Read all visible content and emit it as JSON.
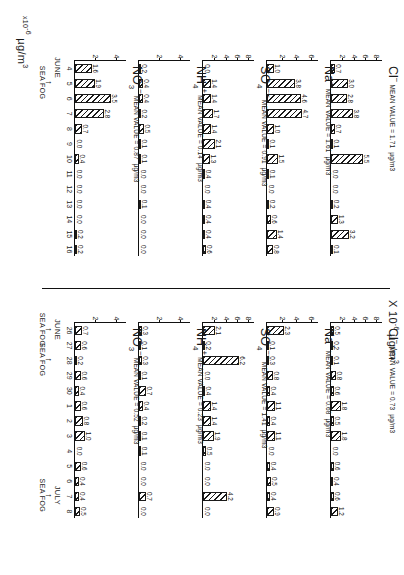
{
  "figure": {
    "caption_left": "µg/m3",
    "axis_label_lower": "x10-6 µg/m3",
    "axis_label_upper": "X 10-6 µg/m3",
    "units_mu": "µg/m",
    "units_exp": "3",
    "x10": "X 10",
    "x10_exp": "-6",
    "month_june": "JUNE",
    "month_july": "JULY",
    "sea_fog": "SEA FOG"
  },
  "chart_data": {
    "type": "bar",
    "ylabel": "µg/m3",
    "xlabel": "Day",
    "grid": false,
    "legend": "none",
    "panels": [
      {
        "id": "cl-period1",
        "species": "Cl",
        "charge": "−",
        "mean_label": "MEAN VALUE = 1.71",
        "mean_value": 1.71,
        "units": "µg/m3",
        "ylim": [
          0,
          9
        ],
        "yticks": [
          2,
          4,
          6,
          8
        ],
        "period": "june-4-16",
        "categories": [
          "4",
          "5",
          "6",
          "7",
          "8",
          "9",
          "10",
          "11",
          "12",
          "13",
          "14",
          "15",
          "16"
        ],
        "values": [
          0.7,
          3.0,
          2.8,
          3.8,
          0.7,
          0.1,
          5.5,
          0.0,
          0.0,
          0.2,
          1.3,
          3.2,
          0.1
        ],
        "extra_value": 0.4
      },
      {
        "id": "na-period1",
        "species": "Na",
        "charge": "+",
        "mean_label": "MEAN VALUE = 1.61",
        "mean_value": 1.61,
        "units": "µg/m3",
        "ylim": [
          0,
          7
        ],
        "yticks": [
          2,
          4,
          6
        ],
        "period": "june-4-16",
        "categories": [
          "4",
          "5",
          "6",
          "7",
          "8",
          "9",
          "10",
          "11",
          "12",
          "13",
          "14",
          "15",
          "16"
        ],
        "values": [
          1.0,
          3.8,
          4.6,
          4.7,
          1.0,
          0.1,
          1.5,
          0.1,
          0.0,
          0.2,
          0.6,
          1.4,
          0.8
        ],
        "extra_value": 1.2
      },
      {
        "id": "so4-period1",
        "species": "SO",
        "charge": "−−",
        "subscript": "4",
        "mean_label": "MEAN VALUE = 0.91",
        "mean_value": 0.91,
        "units": "µg/m3",
        "ylim": [
          0,
          9
        ],
        "yticks": [
          2,
          4,
          6,
          8
        ],
        "period": "june-4-16",
        "categories": [
          "4",
          "5",
          "6",
          "7",
          "8",
          "9",
          "10",
          "11",
          "12",
          "13",
          "14",
          "15",
          "16"
        ],
        "values": [
          0.0,
          1.4,
          1.4,
          1.7,
          1.4,
          2.1,
          1.3,
          0.4,
          0.0,
          0.4,
          0.4,
          0.4,
          0.6
        ],
        "extra_values": [
          0.7,
          0.9
        ]
      },
      {
        "id": "nh4-period1",
        "species": "NH",
        "charge": "+",
        "subscript": "4",
        "mean_label": "MEAN VALUE = 0.14",
        "mean_value": 0.14,
        "units": "µg/m3",
        "ylim": [
          0,
          5
        ],
        "yticks": [
          2,
          4
        ],
        "period": "june-4-16",
        "categories": [
          "4",
          "5",
          "6",
          "7",
          "8",
          "9",
          "10",
          "11",
          "12",
          "13",
          "14",
          "15",
          "16"
        ],
        "values": [
          0.2,
          0.4,
          0.4,
          0.2,
          0.5,
          0.1,
          0.1,
          0.0,
          0.0,
          0.1,
          0.0,
          0.0,
          0.0
        ],
        "extra_values": [
          0.0,
          0.0
        ]
      },
      {
        "id": "no3-period1",
        "species": "NO",
        "charge": "−",
        "subscript": "3",
        "mean_label": "MEAN VALUE = 0.87",
        "mean_value": 0.87,
        "units": "µg/m3",
        "ylim": [
          0,
          5
        ],
        "yticks": [
          2,
          4
        ],
        "period": "june-4-16",
        "categories": [
          "4",
          "5",
          "6",
          "7",
          "8",
          "9",
          "10",
          "11",
          "12",
          "13",
          "14",
          "15",
          "16"
        ],
        "values": [
          1.6,
          1.9,
          3.5,
          2.8,
          0.7,
          0.0,
          0.4,
          0.0,
          0.0,
          0.0,
          0.0,
          0.2,
          0.2
        ],
        "extra_value": 0.8
      },
      {
        "id": "cl-period2",
        "species": "Cl",
        "charge": "−",
        "mean_label": "MEAN VALUE = 0.73",
        "mean_value": 0.73,
        "units": "µg/m3",
        "ylim": [
          0,
          9
        ],
        "yticks": [
          2,
          4,
          6,
          8
        ],
        "period": "june26-july8",
        "categories": [
          "26",
          "27",
          "28",
          "29",
          "30",
          "1",
          "2",
          "3",
          "4",
          "5",
          "6",
          "7",
          "8"
        ],
        "values": [
          0.5,
          0.2,
          0.1,
          0.8,
          0.6,
          1.8,
          0.5,
          1.8,
          0.0,
          0.6,
          0.4,
          0.6,
          1.2
        ]
      },
      {
        "id": "na-period2",
        "species": "Na",
        "charge": "+",
        "mean_label": "MEAN VALUE = 0.68",
        "mean_value": 0.68,
        "units": "µg/m3",
        "ylim": [
          0,
          7
        ],
        "yticks": [
          2,
          4,
          6
        ],
        "period": "june26-july8",
        "categories": [
          "26",
          "27",
          "28",
          "29",
          "30",
          "1",
          "2",
          "3",
          "4",
          "5",
          "6",
          "7",
          "8"
        ],
        "values": [
          2.3,
          0.1,
          0.3,
          0.8,
          0.4,
          1.1,
          0.4,
          1.1,
          0.0,
          0.4,
          0.5,
          0.4,
          0.9
        ]
      },
      {
        "id": "so4-period2",
        "species": "SO",
        "charge": "−−",
        "subscript": "4",
        "mean_label": "MEAN VALUE = 1.41",
        "mean_value": 1.41,
        "units": "µg/m3",
        "ylim": [
          0,
          9
        ],
        "yticks": [
          2,
          4,
          6,
          8
        ],
        "period": "june26-july8",
        "categories": [
          "26",
          "27",
          "28",
          "29",
          "30",
          "1",
          "2",
          "3",
          "4",
          "5",
          "6",
          "7",
          "8"
        ],
        "values": [
          2.1,
          0.2,
          6.2,
          0.0,
          0.4,
          1.4,
          1.4,
          1.9,
          0.5,
          0.0,
          0.0,
          4.2,
          0.0
        ]
      },
      {
        "id": "nh4-period2",
        "species": "NH",
        "charge": "+",
        "subscript": "4",
        "mean_label": "MEAN VALUE = 0.23",
        "mean_value": 0.23,
        "units": "µg/m3",
        "ylim": [
          0,
          5
        ],
        "yticks": [
          2,
          4
        ],
        "period": "june26-july8",
        "categories": [
          "26",
          "27",
          "28",
          "29",
          "30",
          "1",
          "2",
          "3",
          "4",
          "5",
          "6",
          "7",
          "8"
        ],
        "values": [
          0.3,
          0.1,
          0.3,
          0.1,
          0.7,
          0.4,
          0.2,
          0.1,
          0.1,
          0.0,
          0.0,
          0.7,
          0.0
        ]
      },
      {
        "id": "no3-period2",
        "species": "NO",
        "charge": "−",
        "subscript": "3",
        "mean_label": "MEAN VALUE = 0.52",
        "mean_value": 0.52,
        "units": "µg/m3",
        "ylim": [
          0,
          5
        ],
        "yticks": [
          2,
          4
        ],
        "period": "june26-july8",
        "categories": [
          "26",
          "27",
          "28",
          "29",
          "30",
          "1",
          "2",
          "3",
          "4",
          "5",
          "6",
          "7",
          "8"
        ],
        "values": [
          0.7,
          0.6,
          0.2,
          0.6,
          0.4,
          0.6,
          0.8,
          1.0,
          0.0,
          0.6,
          0.4,
          0.4,
          0.5
        ]
      }
    ],
    "annotations": {
      "lower_row": {
        "month": "JUNE",
        "month_at": "4",
        "sea_fog": [
          {
            "label": "SEA FOG",
            "at": "5"
          }
        ]
      },
      "upper_row": {
        "months": [
          {
            "label": "JUNE",
            "at": "26"
          },
          {
            "label": "JULY",
            "at": "7"
          }
        ],
        "sea_fog": [
          {
            "label": "SEA FOG",
            "at": "26"
          },
          {
            "label": "SEA FOG",
            "at": "28"
          },
          {
            "label": "SEA FOG",
            "at": "7"
          }
        ]
      }
    }
  }
}
